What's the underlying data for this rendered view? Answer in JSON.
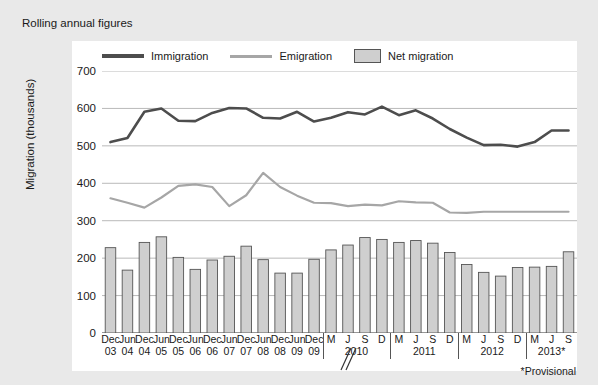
{
  "title": "Rolling annual figures",
  "footnote": "*Provisional",
  "legend": [
    {
      "name": "immigration-series",
      "label": "Immigration",
      "type": "line",
      "color": "#4d4d4d"
    },
    {
      "name": "emigration-series",
      "label": "Emigration",
      "type": "line",
      "color": "#a6a6a6"
    },
    {
      "name": "net-migration-series",
      "label": "Net migration",
      "type": "bar",
      "color": "#cfcfcf"
    }
  ],
  "axis": {
    "ylabel": "Migration (thousands)",
    "yticks": [
      "0",
      "100",
      "200",
      "300",
      "400",
      "500",
      "600",
      "700"
    ],
    "group_labels": [
      "2010",
      "2011",
      "2012",
      "2013*"
    ]
  },
  "chart_data": {
    "type": "bar",
    "title": "Rolling annual figures",
    "xlabel": "",
    "ylabel": "Migration (thousands)",
    "ylim": [
      0,
      700
    ],
    "grid": true,
    "legend_position": "top",
    "categories": [
      "Dec 03",
      "Jun 04",
      "Dec 04",
      "Jun 05",
      "Dec 05",
      "Jun 06",
      "Dec 06",
      "Jun 07",
      "Dec 07",
      "Jun 08",
      "Dec 08",
      "Jun 09",
      "Dec 09",
      "M 2010",
      "J 2010",
      "S 2010",
      "D 2010",
      "M 2011",
      "J 2011",
      "S 2011",
      "D 2011",
      "M 2012",
      "J 2012",
      "S 2012",
      "D 2012",
      "M 2013",
      "J 2013",
      "S 2013"
    ],
    "tick_line1": [
      "Dec",
      "Jun",
      "Dec",
      "Jun",
      "Dec",
      "Jun",
      "Dec",
      "Jun",
      "Dec",
      "Jun",
      "Dec",
      "Jun",
      "Dec",
      "M",
      "J",
      "S",
      "D",
      "M",
      "J",
      "S",
      "D",
      "M",
      "J",
      "S",
      "D",
      "M",
      "J",
      "S"
    ],
    "tick_line2": [
      "03",
      "04",
      "04",
      "05",
      "05",
      "06",
      "06",
      "07",
      "07",
      "08",
      "08",
      "09",
      "09",
      "",
      "",
      "",
      "",
      "",
      "",
      "",
      "",
      "",
      "",
      "",
      "",
      "",
      "",
      ""
    ],
    "series": [
      {
        "name": "Net migration",
        "type": "bar",
        "color": "#cfcfcf",
        "values": [
          228,
          168,
          242,
          257,
          202,
          170,
          195,
          205,
          232,
          196,
          160,
          160,
          197,
          222,
          235,
          255,
          250,
          242,
          247,
          240,
          215,
          183,
          162,
          152,
          175,
          176,
          178,
          217
        ]
      },
      {
        "name": "Immigration",
        "type": "line",
        "color": "#4d4d4d",
        "values": [
          510,
          521,
          591,
          600,
          567,
          566,
          588,
          601,
          600,
          575,
          573,
          591,
          565,
          575,
          590,
          584,
          605,
          582,
          595,
          573,
          545,
          522,
          502,
          503,
          498,
          510,
          541,
          541
        ]
      },
      {
        "name": "Emigration",
        "type": "line",
        "color": "#a6a6a6",
        "values": [
          360,
          348,
          335,
          362,
          393,
          397,
          390,
          339,
          368,
          428,
          390,
          367,
          348,
          347,
          339,
          343,
          341,
          352,
          349,
          348,
          322,
          321,
          324,
          324,
          324,
          324,
          324,
          324
        ]
      }
    ]
  }
}
